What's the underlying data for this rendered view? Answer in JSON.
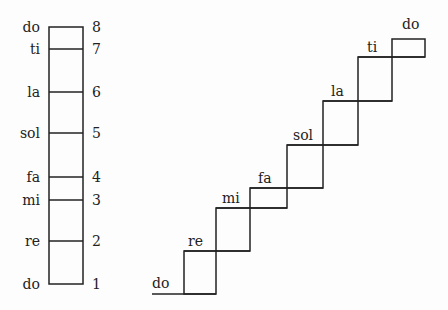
{
  "scale_column": {
    "notes": [
      {
        "syllable": "do",
        "degree": "8",
        "y": 27
      },
      {
        "syllable": "ti",
        "degree": "7",
        "y": 49
      },
      {
        "syllable": "la",
        "degree": "6",
        "y": 92
      },
      {
        "syllable": "sol",
        "degree": "5",
        "y": 133
      },
      {
        "syllable": "fa",
        "degree": "4",
        "y": 177
      },
      {
        "syllable": "mi",
        "degree": "3",
        "y": 200
      },
      {
        "syllable": "re",
        "degree": "2",
        "y": 241
      },
      {
        "syllable": "do",
        "degree": "1",
        "y": 284
      }
    ]
  },
  "staircase": {
    "steps": [
      {
        "syllable": "do"
      },
      {
        "syllable": "re"
      },
      {
        "syllable": "mi"
      },
      {
        "syllable": "fa"
      },
      {
        "syllable": "sol"
      },
      {
        "syllable": "la"
      },
      {
        "syllable": "ti"
      },
      {
        "syllable": "do"
      }
    ]
  }
}
